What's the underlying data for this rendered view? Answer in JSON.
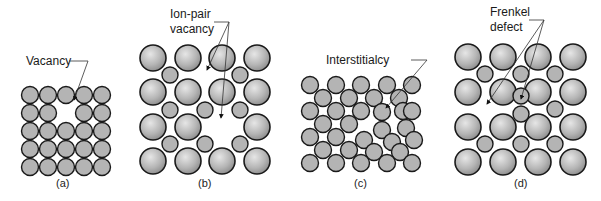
{
  "figure": {
    "panels": [
      {
        "id": "a",
        "caption": "(a)",
        "label_lines": [
          "Vacancy"
        ],
        "defect": "vacancy"
      },
      {
        "id": "b",
        "caption": "(b)",
        "label_lines": [
          "Ion-pair",
          "vacancy"
        ],
        "defect": "ion-pair vacancy"
      },
      {
        "id": "c",
        "caption": "(c)",
        "label_lines": [
          "Interstitialcy"
        ],
        "defect": "interstitialcy"
      },
      {
        "id": "d",
        "caption": "(d)",
        "label_lines": [
          "Frenkel",
          "defect"
        ],
        "defect": "Frenkel defect"
      }
    ],
    "colors": {
      "atom_fill": "#b4b4b4",
      "atom_stroke": "#1a1a1a",
      "leader": "#333333",
      "background": "#ffffff"
    }
  }
}
